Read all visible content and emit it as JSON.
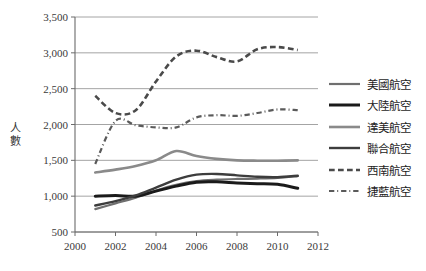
{
  "chart_data": {
    "type": "line",
    "title": "",
    "xlabel": "",
    "ylabel": "人數",
    "xlim": [
      2000,
      2012
    ],
    "ylim": [
      500,
      3500
    ],
    "ytick_labels": [
      "3,500",
      "3,000",
      "2,500",
      "2,000",
      "1,500",
      "1,000",
      "500"
    ],
    "ytick_values": [
      3500,
      3000,
      2500,
      2000,
      1500,
      1000,
      500
    ],
    "xtick_labels": [
      "2000",
      "2002",
      "2004",
      "2006",
      "2008",
      "2010",
      "2012"
    ],
    "xtick_values": [
      2000,
      2002,
      2004,
      2006,
      2008,
      2010,
      2012
    ],
    "grid": "horizontal",
    "legend_position": "right",
    "x": [
      2001,
      2002,
      2003,
      2004,
      2005,
      2006,
      2007,
      2008,
      2009,
      2010,
      2011
    ],
    "series": [
      {
        "name": "美國航空",
        "color": "#6f6f6f",
        "style": "solid",
        "width": 2.2,
        "values": [
          820,
          900,
          980,
          1080,
          1160,
          1210,
          1230,
          1240,
          1245,
          1255,
          1280
        ]
      },
      {
        "name": "大陸航空",
        "color": "#1a1a1a",
        "style": "solid",
        "width": 3.0,
        "values": [
          1000,
          1010,
          1000,
          1070,
          1140,
          1195,
          1200,
          1185,
          1175,
          1165,
          1110
        ]
      },
      {
        "name": "達美航空",
        "color": "#8a8a8a",
        "style": "solid",
        "width": 2.6,
        "values": [
          1330,
          1370,
          1420,
          1500,
          1630,
          1560,
          1520,
          1500,
          1495,
          1495,
          1500
        ]
      },
      {
        "name": "聯合航空",
        "color": "#3d3d3d",
        "style": "solid",
        "width": 2.4,
        "values": [
          870,
          930,
          1010,
          1120,
          1230,
          1300,
          1310,
          1290,
          1270,
          1265,
          1285
        ]
      },
      {
        "name": "西南航空",
        "color": "#4a4a4a",
        "style": "dashed",
        "width": 2.6,
        "values": [
          2400,
          2160,
          2200,
          2600,
          2950,
          3030,
          2940,
          2880,
          3050,
          3080,
          3040
        ]
      },
      {
        "name": "捷藍航空",
        "color": "#5a5a5a",
        "style": "dashdot",
        "width": 2.2,
        "values": [
          1450,
          2050,
          1990,
          1960,
          1960,
          2100,
          2130,
          2120,
          2160,
          2210,
          2200
        ]
      }
    ]
  },
  "legend": {
    "items": [
      {
        "label": "美國航空"
      },
      {
        "label": "大陸航空"
      },
      {
        "label": "達美航空"
      },
      {
        "label": "聯合航空"
      },
      {
        "label": "西南航空"
      },
      {
        "label": "捷藍航空"
      }
    ]
  },
  "axis": {
    "y_title_char1": "人",
    "y_title_char2": "數"
  }
}
